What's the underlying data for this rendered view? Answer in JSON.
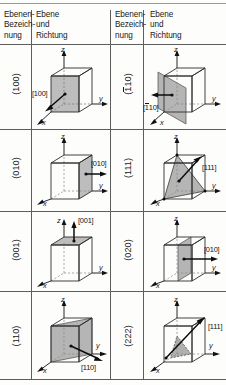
{
  "figure": {
    "columns": [
      {
        "id": "col-index-left",
        "header_lines": [
          "Ebenen-",
          "Bezeich-",
          "nung"
        ]
      },
      {
        "id": "col-diagram-left",
        "header_lines": [
          "Ebene",
          "und",
          "Richtung"
        ]
      },
      {
        "id": "col-index-right",
        "header_lines": [
          "Ebenen-",
          "Bezeich-",
          "nung"
        ]
      },
      {
        "id": "col-diagram-right",
        "header_lines": [
          "Ebene",
          "und",
          "Richtung"
        ]
      }
    ],
    "axis_labels": {
      "x": "x",
      "y": "y",
      "z": "z"
    },
    "rows": [
      {
        "left": {
          "plane_label": "(100)",
          "plane_overbar": "",
          "direction_label": "[100]",
          "direction_overbar": "",
          "plane_type": "face-x",
          "direction_type": "x-diagonal-out"
        },
        "right": {
          "plane_label": "(110)",
          "plane_overbar": "1",
          "direction_label": "[110]",
          "direction_overbar": "1",
          "plane_type": "diagonal-vertical-antiparallel",
          "direction_type": "minus-y-out"
        }
      },
      {
        "left": {
          "plane_label": "(010)",
          "plane_overbar": "",
          "direction_label": "[010]",
          "direction_overbar": "",
          "plane_type": "face-y",
          "direction_type": "y-out"
        },
        "right": {
          "plane_label": "(111)",
          "plane_overbar": "",
          "direction_label": "[111]",
          "direction_overbar": "",
          "plane_type": "triangle-111",
          "direction_type": "body-diagonal"
        }
      },
      {
        "left": {
          "plane_label": "(001)",
          "plane_overbar": "",
          "direction_label": "[001]",
          "direction_overbar": "",
          "plane_type": "face-z-top",
          "direction_type": "z-up"
        },
        "right": {
          "plane_label": "(020)",
          "plane_overbar": "",
          "direction_label": "[010]",
          "direction_overbar": "",
          "plane_type": "mid-plane-y",
          "direction_type": "y-out"
        }
      },
      {
        "left": {
          "plane_label": "(110)",
          "plane_overbar": "",
          "direction_label": "[110]",
          "direction_overbar": "",
          "plane_type": "diagonal-vertical",
          "direction_type": "xy-diagonal"
        },
        "right": {
          "plane_label": "(222)",
          "plane_overbar": "",
          "direction_label": "[111]",
          "direction_overbar": "",
          "plane_type": "triangle-inner-222",
          "direction_type": "body-diagonal"
        }
      }
    ],
    "colors": {
      "rule": "#5d5d5d",
      "plane_fill": "#b8b8b8",
      "cube_edge": "#303030",
      "arrow": "#0d0d0d",
      "background": "#fdfdfc"
    }
  }
}
